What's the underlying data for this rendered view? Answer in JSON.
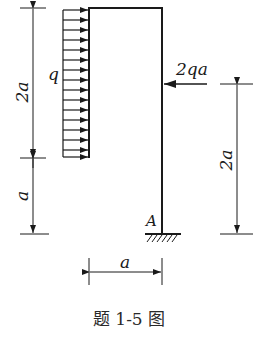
{
  "diagram": {
    "type": "structural-frame",
    "caption": "题 1-5 图",
    "labels": {
      "distributed_load": "q",
      "point_load": "2qa",
      "support": "A",
      "dim_left_upper": "2a",
      "dim_left_lower": "a",
      "dim_right": "2a",
      "dim_bottom": "a"
    },
    "colors": {
      "line": "#1a1a1a",
      "background": "#ffffff"
    }
  }
}
